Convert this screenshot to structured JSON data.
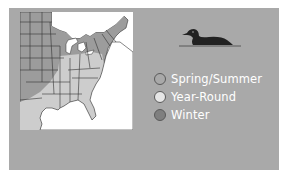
{
  "map": {
    "title": "Range map",
    "icon": "us-range-map"
  },
  "bird": {
    "icon": "loon-silhouette-icon"
  },
  "legend": {
    "items": [
      {
        "label": "Spring/Summer",
        "color": "#a9a9a9"
      },
      {
        "label": "Year-Round",
        "color": "#e6e6e6"
      },
      {
        "label": "Winter",
        "color": "#7f7f7f"
      }
    ]
  },
  "colors": {
    "panel": "#a9a9a9",
    "map_background": "#ffffff",
    "summer_region": "#9a9a9a",
    "yearround_region": "#cfcfcf",
    "winter_region": "#c2c2c2",
    "border": "#333333"
  }
}
